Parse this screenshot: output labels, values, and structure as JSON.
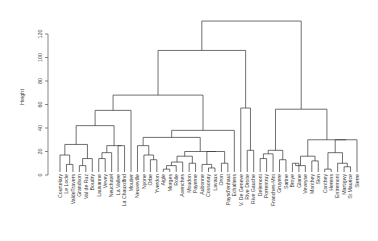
{
  "chart_data": {
    "type": "dendrogram",
    "title": "",
    "xlabel": "",
    "ylabel": "Height",
    "ylim": [
      0,
      135
    ],
    "y_ticks": [
      0,
      20,
      40,
      60,
      80,
      100,
      120
    ],
    "grid": false,
    "leaves": [
      "Courtelary",
      "Le Locle",
      "ValdeTravers",
      "Grandson",
      "Val de Ruz",
      "Boudry",
      "Lausanne",
      "Vevey",
      "Neuchatel",
      "La Vallee",
      "La Chauxdfnd",
      "Moutier",
      "Neuveville",
      "Nyone",
      "Orbe",
      "Yverdon",
      "Aigle",
      "Morges",
      "Rolle",
      "Avenches",
      "Moudon",
      "Payerne",
      "Aubonne",
      "Cossonay",
      "Lavaux",
      "Oron",
      "Paysd'enhaut",
      "Echallens",
      "V. De Geneve",
      "Rive Droite",
      "Rive Gauche",
      "Delemont",
      "Porrentruy",
      "Franches-Mnt",
      "Gruyere",
      "Sarine",
      "Broye",
      "Glane",
      "Veveyse",
      "Monthey",
      "Sion",
      "Conthey",
      "Herens",
      "Entremont",
      "Martigwy",
      "St Maurice",
      "Sierre"
    ],
    "merges": [
      {
        "a": 2,
        "b": 3,
        "h": 9
      },
      {
        "a": 1,
        "b": "m0",
        "h": 17
      },
      {
        "a": 4,
        "b": 5,
        "h": 8
      },
      {
        "a": "m2",
        "b": 6,
        "h": 14
      },
      {
        "a": "m1",
        "b": "m3",
        "h": 26
      },
      {
        "a": 7,
        "b": 8,
        "h": 14
      },
      {
        "a": "m5",
        "b": 9,
        "h": 19
      },
      {
        "a": 10,
        "b": 11,
        "h": 25
      },
      {
        "a": "m6",
        "b": "m7",
        "h": 25
      },
      {
        "a": "m4",
        "b": "m8",
        "h": 42
      },
      {
        "a": "m9",
        "b": 12,
        "h": 55
      },
      {
        "a": 15,
        "b": 16,
        "h": 13
      },
      {
        "a": 14,
        "b": "m11",
        "h": 17
      },
      {
        "a": 13,
        "b": "m12",
        "h": 25
      },
      {
        "a": 17,
        "b": 18,
        "h": 5
      },
      {
        "a": "m14",
        "b": 19,
        "h": 8
      },
      {
        "a": "m15",
        "b": 20,
        "h": 11
      },
      {
        "a": 21,
        "b": 22,
        "h": 10
      },
      {
        "a": "m16",
        "b": "m17",
        "h": 16
      },
      {
        "a": 24,
        "b": 25,
        "h": 6
      },
      {
        "a": 23,
        "b": "m19",
        "h": 9
      },
      {
        "a": 26,
        "b": 27,
        "h": 10
      },
      {
        "a": "m20",
        "b": "m21",
        "h": 20
      },
      {
        "a": "m18",
        "b": "m22",
        "h": 20
      },
      {
        "a": "m13",
        "b": "m23",
        "h": 32
      },
      {
        "a": "m24",
        "b": 28,
        "h": 38
      },
      {
        "a": "m10",
        "b": "m25",
        "h": 68
      },
      {
        "a": 30,
        "b": 31,
        "h": 21
      },
      {
        "a": 29,
        "b": "m27",
        "h": 57
      },
      {
        "a": "m26",
        "b": "m28",
        "h": 106
      },
      {
        "a": 32,
        "b": 33,
        "h": 14
      },
      {
        "a": "m30",
        "b": 34,
        "h": 18
      },
      {
        "a": 35,
        "b": 36,
        "h": 13
      },
      {
        "a": "m31",
        "b": "m32",
        "h": 21
      },
      {
        "a": 37,
        "b": 38,
        "h": 10
      },
      {
        "a": 39,
        "b": "m34",
        "h": 8
      },
      {
        "a": 40,
        "b": 41,
        "h": 12
      },
      {
        "a": "m35",
        "b": "m36",
        "h": 16
      },
      {
        "a": 42,
        "b": 43,
        "h": 5
      },
      {
        "a": 45,
        "b": 46,
        "h": 7
      },
      {
        "a": 44,
        "b": "m39",
        "h": 10
      },
      {
        "a": "m38",
        "b": "m40",
        "h": 19
      },
      {
        "a": "m41",
        "b": 47,
        "h": 30
      },
      {
        "a": "m37",
        "b": "m42",
        "h": 30
      },
      {
        "a": "m33",
        "b": "m43",
        "h": 56
      },
      {
        "a": "m29",
        "b": "m44",
        "h": 131
      }
    ]
  }
}
